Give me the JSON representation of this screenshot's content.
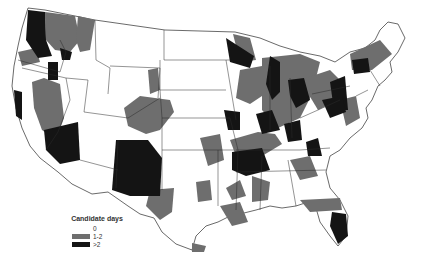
{
  "map": {
    "title": "",
    "region": "Contiguous United States",
    "colors": {
      "zero": "#ffffff",
      "one_two": "#6e6e6e",
      "gt_two": "#141414",
      "border": "#2a2a2a"
    }
  },
  "legend": {
    "title": "Candidate days",
    "items": [
      {
        "label": "0",
        "color": "#ffffff"
      },
      {
        "label": "1-2",
        "color": "#6e6e6e"
      },
      {
        "label": ">2",
        "color": "#141414"
      }
    ]
  }
}
